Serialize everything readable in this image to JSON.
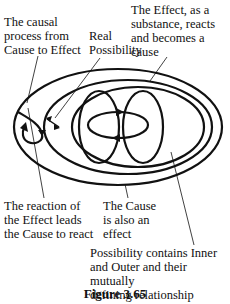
{
  "labels": {
    "causal_process": "The causal\nprocess from\nCause to Effect",
    "real_possibility": "Real\nPossibility",
    "effect_substance": "The Effect, as a\nsubstance, reacts\nand becomes a\ncause",
    "reaction_effect": "The reaction of\nthe Effect leads\nthe Cause to react",
    "cause_effect": "The Cause\nis also an\neffect",
    "possibility_contains": "Possibility contains Inner\nand Outer and their mutually\ndefining relationship"
  },
  "caption": "Figure 3.65",
  "colors": {
    "stroke": "#111111",
    "background": "#ffffff"
  }
}
